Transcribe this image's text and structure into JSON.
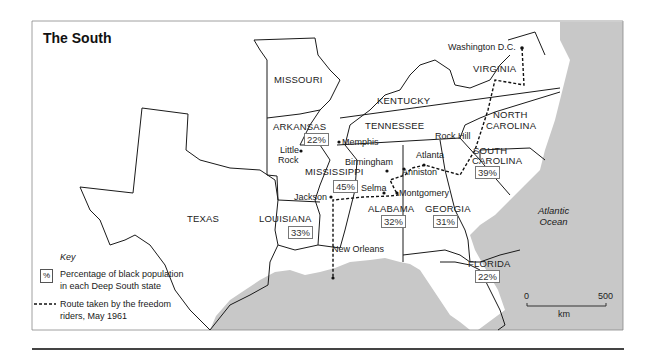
{
  "title": "The South",
  "states": {
    "missouri": "MISSOURI",
    "kentucky": "KENTUCKY",
    "virginia": "VIRGINIA",
    "arkansas": "ARKANSAS",
    "tennessee": "TENNESSEE",
    "north_carolina_1": "NORTH",
    "north_carolina_2": "CAROLINA",
    "south_carolina_1": "SOUTH",
    "south_carolina_2": "CAROLINA",
    "mississippi": "MISSISSIPPI",
    "alabama": "ALABAMA",
    "georgia": "GEORGIA",
    "texas": "TEXAS",
    "louisiana": "LOUISIANA",
    "florida": "FLORIDA"
  },
  "percentages": {
    "arkansas": "22%",
    "mississippi": "45%",
    "alabama": "32%",
    "georgia": "31%",
    "south_carolina": "39%",
    "louisiana": "33%",
    "florida": "22%"
  },
  "cities": {
    "washington": "Washington D.C.",
    "memphis": "Memphis",
    "little_rock_1": "Little",
    "little_rock_2": "Rock",
    "rock_hill": "Rock Hill",
    "atlanta": "Atlanta",
    "birmingham": "Birmingham",
    "anniston": "Anniston",
    "selma": "Selma",
    "montgomery": "Montgomery",
    "jackson": "Jackson",
    "new_orleans": "New Orleans"
  },
  "ocean": {
    "line1": "Atlantic",
    "line2": "Ocean"
  },
  "key": {
    "title": "Key",
    "pct_symbol": "%",
    "pct_line1": "Percentage of black population",
    "pct_line2": "in each Deep South state",
    "route_line1": "Route taken by the freedom",
    "route_line2": "riders, May 1961"
  },
  "scale": {
    "start": "0",
    "end": "500",
    "unit": "km"
  },
  "colors": {
    "sea": "#c8c8c8",
    "land": "#ffffff",
    "border": "#1a1a1a"
  }
}
